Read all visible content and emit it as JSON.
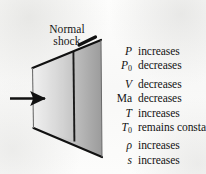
{
  "figure": {
    "background_color": "#fbfbfa",
    "ink_color": "#131313"
  },
  "shock_label": {
    "line1": "Normal",
    "line2": "shock"
  },
  "flow_arrow": {
    "name": "flow-direction-arrow",
    "direction": "right"
  },
  "duct": {
    "fill_light": "#f2f2f2",
    "fill_dark": "#9a9a9a",
    "outline_color": "#111111",
    "shock_line_color": "#1a1a1a"
  },
  "property_list": [
    {
      "symbol": "P",
      "subscript": "",
      "upright": false,
      "change": "increases"
    },
    {
      "symbol": "P",
      "subscript": "0",
      "upright": false,
      "change": "decreases"
    },
    {
      "symbol": "V",
      "subscript": "",
      "upright": false,
      "change": "decreases"
    },
    {
      "symbol": "Ma",
      "subscript": "",
      "upright": true,
      "change": "decreases"
    },
    {
      "symbol": "T",
      "subscript": "",
      "upright": false,
      "change": "increases"
    },
    {
      "symbol": "T",
      "subscript": "0",
      "upright": false,
      "change": "remains constant"
    },
    {
      "symbol": "ρ",
      "subscript": "",
      "upright": false,
      "change": "increases"
    },
    {
      "symbol": "s",
      "subscript": "",
      "upright": false,
      "change": "increases"
    }
  ]
}
